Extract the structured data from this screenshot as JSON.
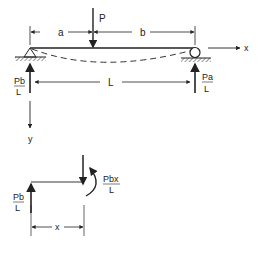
{
  "diagram": {
    "labels": {
      "load": "P",
      "dim_a": "a",
      "dim_b": "b",
      "dim_L": "L",
      "axis_x": "x",
      "axis_y": "y",
      "left_reaction_num": "Pb",
      "left_reaction_den": "L",
      "right_reaction_num": "Pa",
      "right_reaction_den": "L",
      "fbd_reaction_num": "Pb",
      "fbd_reaction_den": "L",
      "fbd_moment_num": "Pbx",
      "fbd_moment_den": "L",
      "fbd_dim_x": "x"
    },
    "colors": {
      "stroke": "#222222",
      "background": "#ffffff"
    }
  }
}
